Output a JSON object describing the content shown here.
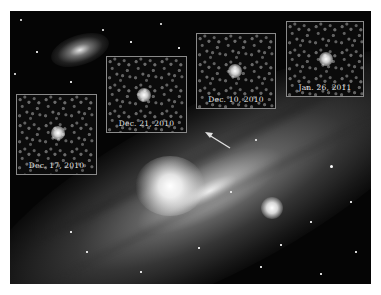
{
  "image": {
    "subject": "Andromeda Galaxy (M31) with nova inset frames",
    "background_color": "#ffffff",
    "frame_color": "#8a8a8a",
    "label_color": "#e6e6e6"
  },
  "insets": [
    {
      "label": "Dec. 17, 2010"
    },
    {
      "label": "Dec. 21, 2010"
    },
    {
      "label": "Dec. 10, 2010"
    },
    {
      "label": "Jan. 26, 2011"
    }
  ],
  "arrow": {
    "color": "#e0e0e0",
    "direction": "points up-left toward nova position"
  }
}
